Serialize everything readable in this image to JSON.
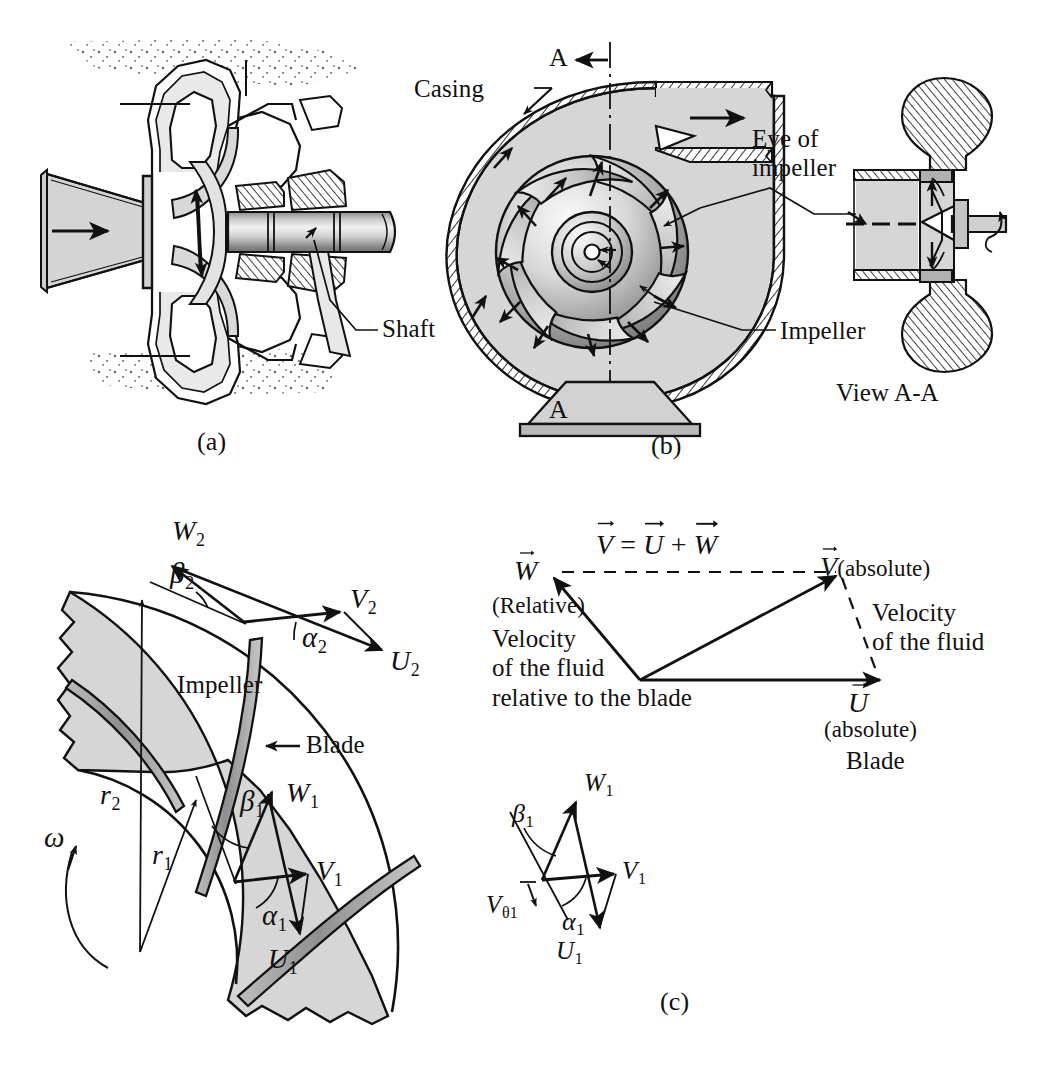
{
  "figure": {
    "caption_note": "Centrifugal pump: cutaway, casing/impeller view, and velocity diagrams",
    "panels": [
      {
        "id": "a",
        "label": "(a)"
      },
      {
        "id": "b",
        "label": "(b)"
      },
      {
        "id": "c",
        "label": "(c)"
      }
    ]
  },
  "panel_a": {
    "label": "(a)",
    "callouts": [
      {
        "name": "shaft",
        "text": "Shaft"
      }
    ]
  },
  "panel_b": {
    "label": "(b)",
    "callouts": [
      {
        "name": "casing",
        "text": "Casing"
      },
      {
        "name": "eye-of-impeller",
        "line1": "Eye of",
        "line2": "impeller"
      },
      {
        "name": "impeller",
        "text": "Impeller"
      }
    ],
    "section_marks": {
      "top": "A",
      "bottom": "A"
    },
    "view_label": "View A-A"
  },
  "panel_c": {
    "label": "(c)",
    "impeller_label": "Impeller",
    "blade_label": "Blade",
    "symbols": {
      "omega": "ω",
      "r1": {
        "base": "r",
        "sub": "1"
      },
      "r2": {
        "base": "r",
        "sub": "2"
      },
      "W1": {
        "base": "W",
        "sub": "1"
      },
      "W2": {
        "base": "W",
        "sub": "2"
      },
      "V1": {
        "base": "V",
        "sub": "1"
      },
      "V2": {
        "base": "V",
        "sub": "2"
      },
      "U1": {
        "base": "U",
        "sub": "1"
      },
      "U2": {
        "base": "U",
        "sub": "2"
      },
      "alpha1": {
        "base": "α",
        "sub": "1"
      },
      "alpha2": {
        "base": "α",
        "sub": "2"
      },
      "beta1": {
        "base": "β",
        "sub": "1"
      },
      "beta2": {
        "base": "β",
        "sub": "2"
      },
      "Vtheta1": {
        "base": "V",
        "sub": "θ1"
      }
    },
    "vector_triangle": {
      "equation_terms": {
        "V": "V",
        "eq": "=",
        "U": "U",
        "plus": "+",
        "W": "W"
      },
      "W_symbol": "W",
      "V_symbol": "V",
      "U_symbol": "U",
      "W_note": "(Relative)",
      "V_note": "(absolute)",
      "U_note": "(absolute)",
      "relative_text_lines": [
        "Velocity",
        "of the fluid",
        "relative to the blade"
      ],
      "absolute_text_lines": [
        "Velocity",
        "of the fluid"
      ],
      "blade_text": "Blade"
    }
  },
  "colors": {
    "ink": "#111111",
    "fluid_gray": "#d4d4d4",
    "metal_gray": "#c9c9c9",
    "light_gray": "#e6e6e6",
    "dark_gray": "#8f8f8f",
    "page_bg": "#ffffff"
  }
}
